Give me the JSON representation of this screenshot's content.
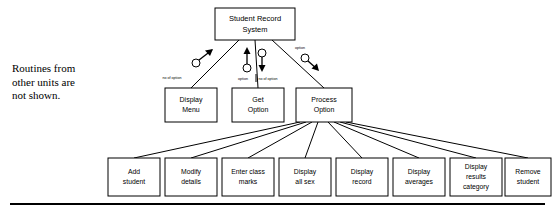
{
  "diagram": {
    "type": "structure-chart",
    "note": "Routines from\nother units are\nnot shown.",
    "root": {
      "id": "student-record-system",
      "label_line1": "Student Record",
      "label_line2": "System",
      "x": 215,
      "y": 8,
      "w": 80,
      "h": 32
    },
    "level2": [
      {
        "id": "display-menu",
        "label_line1": "Display",
        "label_line2": "Menu",
        "x": 165,
        "y": 88,
        "w": 52,
        "h": 34
      },
      {
        "id": "get-option",
        "label_line1": "Get",
        "label_line2": "Option",
        "x": 232,
        "y": 88,
        "w": 52,
        "h": 34
      },
      {
        "id": "process-option",
        "label_line1": "Process",
        "label_line2": "Option",
        "x": 296,
        "y": 88,
        "w": 56,
        "h": 34
      }
    ],
    "level3": [
      {
        "id": "add-student",
        "label_line1": "Add",
        "label_line2": "student",
        "label_line3": "",
        "x": 108,
        "y": 158,
        "w": 52,
        "h": 38
      },
      {
        "id": "modify-details",
        "label_line1": "Modify",
        "label_line2": "details",
        "label_line3": "",
        "x": 165,
        "y": 158,
        "w": 52,
        "h": 38
      },
      {
        "id": "enter-class-marks",
        "label_line1": "Enter class",
        "label_line2": "marks",
        "label_line3": "",
        "x": 222,
        "y": 158,
        "w": 52,
        "h": 38
      },
      {
        "id": "display-all-sex",
        "label_line1": "Display",
        "label_line2": "all sex",
        "label_line3": "",
        "x": 279,
        "y": 158,
        "w": 52,
        "h": 38
      },
      {
        "id": "display-record",
        "label_line1": "Display",
        "label_line2": "record",
        "label_line3": "",
        "x": 336,
        "y": 158,
        "w": 52,
        "h": 38
      },
      {
        "id": "display-averages",
        "label_line1": "Display",
        "label_line2": "averages",
        "label_line3": "",
        "x": 393,
        "y": 158,
        "w": 52,
        "h": 38
      },
      {
        "id": "display-results-category",
        "label_line1": "Display",
        "label_line2": "results",
        "label_line3": "category",
        "x": 450,
        "y": 158,
        "w": 52,
        "h": 38
      },
      {
        "id": "remove-student",
        "label_line1": "Remove",
        "label_line2": "student",
        "label_line3": "",
        "x": 505,
        "y": 158,
        "w": 46,
        "h": 38
      }
    ],
    "flows": [
      {
        "id": "flow-no-of-option-left",
        "label": "no of option",
        "label_x": 172,
        "label_y": 79,
        "direction": "up",
        "kind": "data-couple"
      },
      {
        "id": "flow-option-center",
        "label": "option",
        "label_x": 243,
        "label_y": 80,
        "direction": "up",
        "kind": "data-couple"
      },
      {
        "id": "flow-no-of-option-center",
        "label": "no of option",
        "label_x": 268,
        "label_y": 80,
        "direction": "down",
        "kind": "data-couple"
      },
      {
        "id": "flow-option-right",
        "label": "option",
        "label_x": 300,
        "label_y": 49,
        "direction": "down",
        "kind": "data-couple"
      }
    ],
    "colors": {
      "stroke": "#000000",
      "fill": "#ffffff",
      "text": "#000000"
    }
  }
}
